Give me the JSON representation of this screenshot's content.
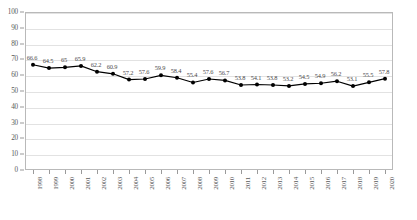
{
  "chart_data": {
    "type": "line",
    "title": "",
    "subtitle": "",
    "xlabel": "",
    "ylabel": "",
    "ylim": [
      0,
      100
    ],
    "ytick_step": 10,
    "yticks": [
      0,
      10,
      20,
      30,
      40,
      50,
      60,
      70,
      80,
      90,
      100
    ],
    "grid": true,
    "grid_axis": "y",
    "legend": false,
    "legend_position": "none",
    "marker": "filled-circle",
    "line_color": "#000000",
    "marker_color": "#000000",
    "data_labels": true,
    "xtick_rotation": -90,
    "categories": [
      "1998",
      "1999",
      "2000",
      "2001",
      "2002",
      "2003",
      "2004",
      "2005",
      "2006",
      "2007",
      "2008",
      "2009",
      "2010",
      "2011",
      "2012",
      "2013",
      "2014",
      "2015",
      "2016",
      "2017",
      "2018",
      "2019",
      "2020"
    ],
    "values": [
      66.6,
      64.5,
      65,
      65.9,
      62.2,
      60.9,
      57.2,
      57.6,
      59.9,
      58.4,
      55.4,
      57.6,
      56.7,
      53.8,
      54.1,
      53.8,
      53.2,
      54.5,
      54.9,
      56.2,
      53.1,
      55.5,
      57.8
    ],
    "value_labels": [
      "66.6",
      "64.5",
      "65",
      "65.9",
      "62.2",
      "60.9",
      "57.2",
      "57.6",
      "59.9",
      "58.4",
      "55.4",
      "57.6",
      "56.7",
      "53.8",
      "54.1",
      "53.8",
      "53.2",
      "54.5",
      "54.9",
      "56.2",
      "53.1",
      "55.5",
      "57.8"
    ]
  }
}
